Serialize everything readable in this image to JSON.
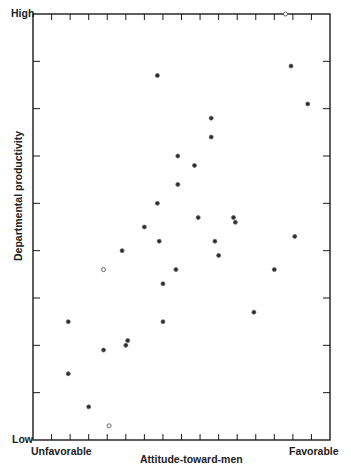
{
  "chart_data": {
    "type": "scatter",
    "title": "",
    "xlabel": "Attitude-toward-men",
    "ylabel": "Departmental productivity",
    "x_axis": {
      "low_label": "Unfavorable",
      "high_label": "Favorable",
      "range": [
        0,
        16
      ],
      "tick_count": 15,
      "numeric_tick_labels": false
    },
    "y_axis": {
      "low_label": "Low",
      "high_label": "High",
      "range": [
        0,
        9
      ],
      "tick_count": 8,
      "numeric_tick_labels": false
    },
    "grid": false,
    "legend": null,
    "series": [
      {
        "name": "filled",
        "marker": "filled-circle",
        "points": [
          [
            6.7,
            7.7
          ],
          [
            9.6,
            6.8
          ],
          [
            9.6,
            6.4
          ],
          [
            7.8,
            6.0
          ],
          [
            8.7,
            5.8
          ],
          [
            7.8,
            5.4
          ],
          [
            6.7,
            5.0
          ],
          [
            8.9,
            4.7
          ],
          [
            10.8,
            4.7
          ],
          [
            10.9,
            4.6
          ],
          [
            6.0,
            4.5
          ],
          [
            6.8,
            4.2
          ],
          [
            9.8,
            4.2
          ],
          [
            4.8,
            4.0
          ],
          [
            10.0,
            3.9
          ],
          [
            7.7,
            3.6
          ],
          [
            7.0,
            3.3
          ],
          [
            7.0,
            2.5
          ],
          [
            1.9,
            2.5
          ],
          [
            3.8,
            1.9
          ],
          [
            5.1,
            2.1
          ],
          [
            5.0,
            2.0
          ],
          [
            1.9,
            1.4
          ],
          [
            3.0,
            0.7
          ],
          [
            13.9,
            7.9
          ],
          [
            14.8,
            7.1
          ],
          [
            14.1,
            4.3
          ],
          [
            13.0,
            3.6
          ],
          [
            11.9,
            2.7
          ]
        ]
      },
      {
        "name": "open",
        "marker": "open-circle",
        "points": [
          [
            3.8,
            3.6
          ],
          [
            4.1,
            0.3
          ],
          [
            13.6,
            9.0
          ]
        ]
      }
    ]
  },
  "labels": {
    "y_high": "High",
    "y_low": "Low",
    "x_low": "Unfavorable",
    "x_high": "Favorable",
    "x_title": "Attitude-toward-men",
    "y_title": "Departmental productivity"
  },
  "colors": {
    "ink": "#1a1a1a",
    "background": "#ffffff"
  }
}
